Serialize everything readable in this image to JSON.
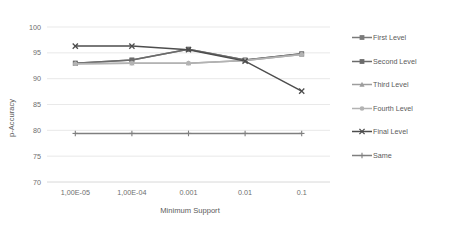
{
  "chart_data": {
    "type": "line",
    "title": "",
    "xlabel": "Minimum Support",
    "ylabel": "p-Accuracy",
    "categories": [
      "1,00E-05",
      "1,00E-04",
      "0.001",
      "0.01",
      "0.1"
    ],
    "ylim": [
      70,
      100
    ],
    "yticks": [
      70,
      75,
      80,
      85,
      90,
      95,
      100
    ],
    "grid": "horizontal",
    "legend_position": "right",
    "series": [
      {
        "name": "First Level",
        "values": [
          93.0,
          93.6,
          95.7,
          93.6,
          94.8
        ],
        "color": "#7a7a7a",
        "marker": "square"
      },
      {
        "name": "Second Level",
        "values": [
          93.0,
          93.6,
          95.7,
          93.6,
          94.8
        ],
        "color": "#6b6b6b",
        "marker": "square"
      },
      {
        "name": "Third Level",
        "values": [
          92.9,
          93.0,
          93.0,
          93.5,
          94.7
        ],
        "color": "#9d9d9d",
        "marker": "triangle"
      },
      {
        "name": "Fourth Level",
        "values": [
          92.9,
          93.0,
          93.0,
          93.5,
          94.7
        ],
        "color": "#b3b3b3",
        "marker": "circle"
      },
      {
        "name": "Final Level",
        "values": [
          96.3,
          96.3,
          95.6,
          93.4,
          87.6
        ],
        "color": "#4d4d4d",
        "marker": "cross"
      },
      {
        "name": "Same",
        "values": [
          79.4,
          79.4,
          79.4,
          79.4,
          79.4
        ],
        "color": "#7f7f7f",
        "marker": "plus"
      }
    ]
  },
  "legend": {
    "items": [
      "First Level",
      "Second Level",
      "Third Level",
      "Fourth Level",
      "Final Level",
      "Same"
    ]
  },
  "axes": {
    "y_label": "p-Accuracy",
    "x_label": "Minimum Support",
    "y_ticks": [
      "100",
      "95",
      "90",
      "85",
      "80",
      "75",
      "70"
    ],
    "x_ticks": [
      "1,00E-05",
      "1,00E-04",
      "0.001",
      "0.01",
      "0.1"
    ]
  },
  "colors": {
    "gridline": "#e0e0e0",
    "axisline": "#d4d4d4",
    "text": "#6e6e6e",
    "background": "#ffffff"
  }
}
